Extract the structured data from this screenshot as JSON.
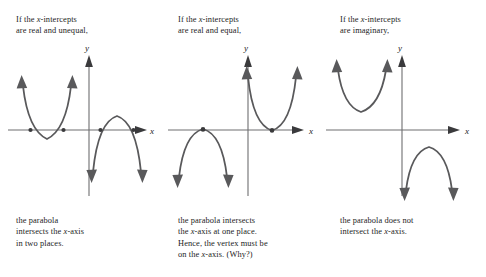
{
  "figure": {
    "background_color": "#ffffff",
    "curve_color": "#59595b",
    "axis_color": "#6e6e70",
    "text_color": "#1c1c1c"
  },
  "panels": [
    {
      "id": "real-and-unequal",
      "top_caption": {
        "line1_pre": "If the ",
        "line1_ital": "x",
        "line1_post": "-intercepts",
        "line2": "are real and unequal,"
      },
      "axis": {
        "x_label": "x",
        "y_label": "y"
      },
      "bottom_caption": {
        "line1": "the parabola",
        "line2_pre": "intersects the ",
        "line2_ital": "x",
        "line2_post": "-axis",
        "line3": "in two places."
      },
      "curves": [
        {
          "name": "left-parabola-opens-up",
          "direction": "up",
          "intercepts": 2,
          "marker_dots": 2
        },
        {
          "name": "right-parabola-opens-down",
          "direction": "down",
          "intercepts": 2,
          "marker_dots": 2
        }
      ]
    },
    {
      "id": "real-and-equal",
      "top_caption": {
        "line1_pre": "If the ",
        "line1_ital": "x",
        "line1_post": "-intercepts",
        "line2": "are real and equal,"
      },
      "axis": {
        "x_label": "x",
        "y_label": "y"
      },
      "bottom_caption": {
        "line1": "the parabola intersects",
        "line2_pre": "the ",
        "line2_ital": "x",
        "line2_post": "-axis at one place.",
        "line3": "Hence, the vertex must be",
        "line4_pre": "on the ",
        "line4_ital": "x",
        "line4_post": "-axis. (Why?)"
      },
      "curves": [
        {
          "name": "left-parabola-opens-down",
          "direction": "down",
          "intercepts": 1,
          "marker_dots": 1
        },
        {
          "name": "right-parabola-opens-up",
          "direction": "up",
          "intercepts": 1,
          "marker_dots": 1
        }
      ]
    },
    {
      "id": "imaginary",
      "top_caption": {
        "line1_pre": "If the ",
        "line1_ital": "x",
        "line1_post": "-intercepts",
        "line2": "are imaginary,"
      },
      "axis": {
        "x_label": "x",
        "y_label": "y"
      },
      "bottom_caption": {
        "line1": "the parabola does not",
        "line2_pre": "intersect the ",
        "line2_ital": "x",
        "line2_post": "-axis."
      },
      "curves": [
        {
          "name": "upper-parabola-opens-up",
          "direction": "up",
          "intercepts": 0,
          "marker_dots": 0
        },
        {
          "name": "lower-parabola-opens-down",
          "direction": "down",
          "intercepts": 0,
          "marker_dots": 0
        }
      ]
    }
  ]
}
